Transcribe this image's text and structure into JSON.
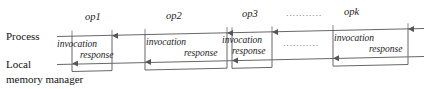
{
  "diagram": {
    "title_visible": false,
    "background_color": "#ffffff",
    "line_color": "#55565a",
    "text_color": "#1a1a1a",
    "axes": [
      {
        "id": "process",
        "label": "Process",
        "label_line2": ""
      },
      {
        "id": "local-memory-manager",
        "label": "Local",
        "label_line2": "memory manager"
      }
    ],
    "operations": [
      {
        "id": "op1",
        "label": "op1",
        "invocation_label": "invocation",
        "response_label": "response"
      },
      {
        "id": "op2",
        "label": "op2",
        "invocation_label": "invocation",
        "response_label": "response"
      },
      {
        "id": "op3",
        "label": "op3",
        "invocation_label": "invocation",
        "response_label": "response"
      },
      {
        "id": "opk",
        "label": "opk",
        "invocation_label": "invocation",
        "response_label": "response"
      }
    ],
    "ellipses": [
      {
        "id": "ellipsis-top",
        "text": "···········"
      },
      {
        "id": "ellipsis-middle",
        "text": "···········"
      }
    ]
  }
}
